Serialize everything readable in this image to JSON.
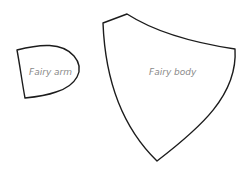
{
  "pattern_pieces": [
    {
      "id": "arm",
      "label": "Fairy arm"
    },
    {
      "id": "body",
      "label": "Fairy body"
    }
  ],
  "colors": {
    "outline": "#1c1c1c",
    "label": "#8a8a8a",
    "background": "#ffffff"
  }
}
